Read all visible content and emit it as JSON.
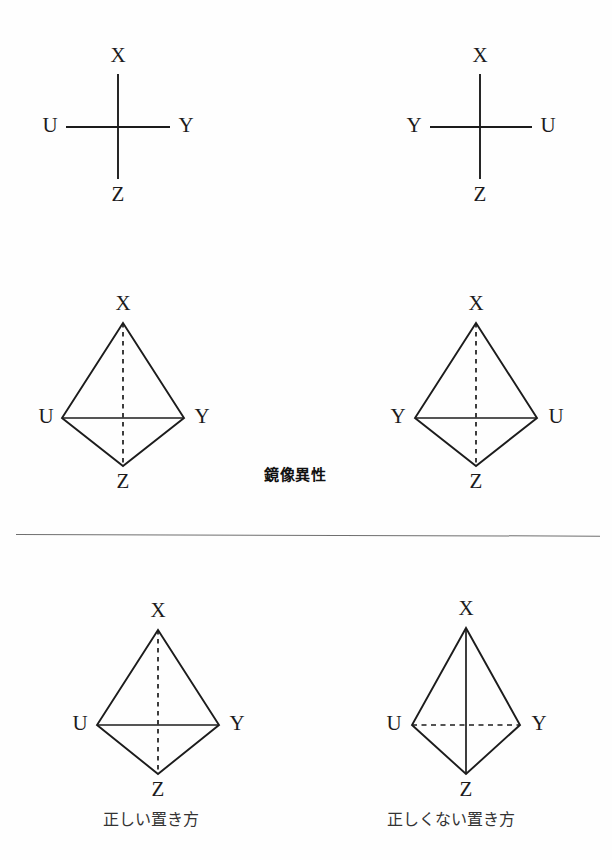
{
  "document": {
    "language": "ja",
    "subject": "stereochemistry-mirror-image-isomerism",
    "background_color": "#fefefe",
    "ink_color": "#1c1c1c"
  },
  "labels": {
    "X": "X",
    "Y": "Y",
    "Z": "Z",
    "U": "U"
  },
  "annotations": {
    "center_note": "鏡像異性",
    "caption_correct": "正しい置き方",
    "caption_incorrect": "正しくない置き方"
  },
  "figures": [
    {
      "id": "cross-left",
      "type": "cross-projection",
      "top": "X",
      "left": "U",
      "right": "Y",
      "bottom": "Z",
      "vertical_style": "solid",
      "horizontal_style": "solid"
    },
    {
      "id": "cross-right",
      "type": "cross-projection",
      "top": "X",
      "left": "Y",
      "right": "U",
      "bottom": "Z",
      "vertical_style": "solid",
      "horizontal_style": "solid"
    },
    {
      "id": "tetra-left",
      "type": "tetrahedron",
      "apex": "X",
      "left": "U",
      "right": "Y",
      "bottom": "Z",
      "vertical_style": "dashed",
      "horizontal_style": "solid"
    },
    {
      "id": "tetra-right",
      "type": "tetrahedron",
      "apex": "X",
      "left": "Y",
      "right": "U",
      "bottom": "Z",
      "vertical_style": "dashed",
      "horizontal_style": "solid"
    },
    {
      "id": "tetra-correct",
      "type": "tetrahedron",
      "apex": "X",
      "left": "U",
      "right": "Y",
      "bottom": "Z",
      "vertical_style": "dashed",
      "horizontal_style": "solid"
    },
    {
      "id": "tetra-incorrect",
      "type": "tetrahedron",
      "apex": "X",
      "left": "U",
      "right": "Y",
      "bottom": "Z",
      "vertical_style": "solid",
      "horizontal_style": "dashed"
    }
  ]
}
